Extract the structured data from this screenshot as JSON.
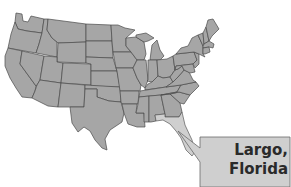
{
  "map": {
    "region": "Contiguous United States",
    "style": "state outlines",
    "highlighted_state": "Florida",
    "colors": {
      "state_fill": "#a6a6a6",
      "state_border": "#4a4a4a",
      "highlight_fill": "#cfcfcf",
      "callout_fill": "#cfcfcf",
      "label_text": "#2a2a2a"
    }
  },
  "callout": {
    "line1": "Largo,",
    "line2": "Florida"
  }
}
